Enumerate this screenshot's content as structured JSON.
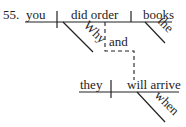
{
  "diagram": {
    "type": "sentence-diagram",
    "number": "55.",
    "clause1": {
      "subject": "you",
      "verb": "did order",
      "object": "books",
      "modifiers": {
        "verb": "Why",
        "object": "the"
      }
    },
    "conjunction": "and",
    "clause2": {
      "subject": "they",
      "verb": "will arrive",
      "modifiers": {
        "verb": "when"
      }
    }
  }
}
